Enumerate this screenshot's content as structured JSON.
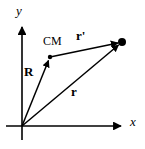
{
  "figure": {
    "background_color": "#ffffff",
    "stroke_color": "#000000",
    "width": 145,
    "height": 149
  },
  "axes": {
    "x_label": "x",
    "y_label": "y",
    "origin": {
      "x": 22,
      "y": 126
    },
    "x_axis": {
      "x1": 6,
      "y1": 126,
      "x2": 125,
      "y2": 126,
      "arrow": "right"
    },
    "y_axis": {
      "x1": 22,
      "y1": 140,
      "x2": 22,
      "y2": 22,
      "arrow": "up"
    }
  },
  "points": [
    {
      "name": "origin",
      "label": "",
      "x": 22,
      "y": 126,
      "dot": false
    },
    {
      "name": "center-of-mass",
      "label": "CM",
      "x": 50,
      "y": 57,
      "dot": true
    },
    {
      "name": "particle",
      "label": "",
      "x": 122,
      "y": 42,
      "dot": true
    }
  ],
  "vectors": [
    {
      "name": "R",
      "label": "R",
      "description": "position vector from origin to center of mass",
      "from": {
        "x": 22,
        "y": 126
      },
      "to": {
        "x": 50,
        "y": 57
      },
      "label_pos": {
        "x": 28,
        "y": 72
      }
    },
    {
      "name": "r",
      "label": "r",
      "description": "position vector from origin to particle",
      "from": {
        "x": 22,
        "y": 126
      },
      "to": {
        "x": 122,
        "y": 42
      },
      "label_pos": {
        "x": 75,
        "y": 92
      }
    },
    {
      "name": "r-prime",
      "label": "r'",
      "description": "position vector from center of mass to particle",
      "from": {
        "x": 50,
        "y": 57
      },
      "to": {
        "x": 122,
        "y": 42
      },
      "label_pos": {
        "x": 80,
        "y": 36
      }
    }
  ]
}
